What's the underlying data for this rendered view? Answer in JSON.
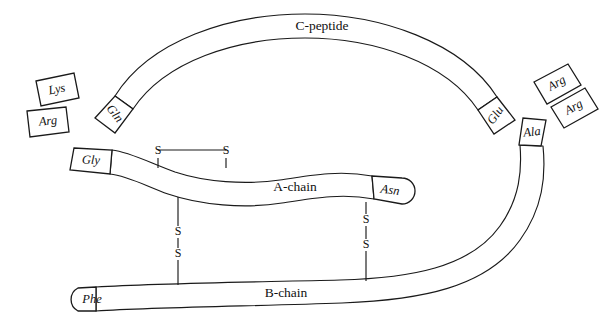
{
  "diagram": {
    "background_color": "#ffffff",
    "stroke_color": "#1a1a1a",
    "chains": {
      "c_peptide": {
        "label": "C-peptide"
      },
      "a_chain": {
        "label": "A-chain"
      },
      "b_chain": {
        "label": "B-chain"
      }
    },
    "residues": {
      "lys_left": "Lys",
      "arg_left": "Arg",
      "gln": "Gln",
      "glu": "Glu",
      "arg_right_upper": "Arg",
      "arg_right_lower": "Arg",
      "ala": "Ala",
      "gly": "Gly",
      "asn": "Asn",
      "phe": "Phe"
    },
    "disulfide_bonds": {
      "intrachain_a": {
        "left_sulfur": "S",
        "right_sulfur": "S"
      },
      "interchain_left": {
        "upper_sulfur": "S",
        "lower_sulfur": "S"
      },
      "interchain_right": {
        "upper_sulfur": "S",
        "lower_sulfur": "S"
      }
    }
  }
}
